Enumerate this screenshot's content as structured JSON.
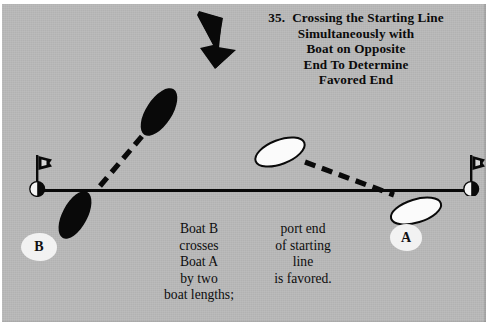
{
  "figure": {
    "number": "35.",
    "title_lines": [
      "Crossing the Starting Line",
      "Simultaneously with",
      "Boat on Opposite",
      "End To Determine",
      "Favored End"
    ]
  },
  "colors": {
    "background": "#b9b9b9",
    "ink": "#0a0a0a",
    "boat_a_fill": "#fbfbfb",
    "boat_b_fill": "#090909",
    "label_blob": "#f2f2f2",
    "page": "#ffffff"
  },
  "wind": {
    "icon": "down-arrow-icon",
    "label": "wind direction"
  },
  "starting_line": {
    "label": "starting line",
    "port_end_marker": "left-buoy",
    "starboard_end_marker": "right-buoy"
  },
  "marks": {
    "left": {
      "icon": "buoy-with-flag-icon",
      "name": "port-end-buoy"
    },
    "right": {
      "icon": "buoy-with-flag-icon",
      "name": "starboard-end-buoy"
    }
  },
  "boats": {
    "a": {
      "label": "A",
      "fill": "white",
      "positions": [
        "upper-left-of-line",
        "lower-right-across-line"
      ],
      "track": "dashed"
    },
    "b": {
      "label": "B",
      "fill": "black",
      "positions": [
        "upper-right-of-line",
        "lower-left-across-line"
      ],
      "track": "dashed"
    }
  },
  "caption": {
    "left_column": [
      "Boat B",
      "crosses",
      "Boat A",
      "by two",
      "boat lengths;"
    ],
    "right_column": [
      "port end",
      "of starting",
      "line",
      "is favored."
    ]
  }
}
